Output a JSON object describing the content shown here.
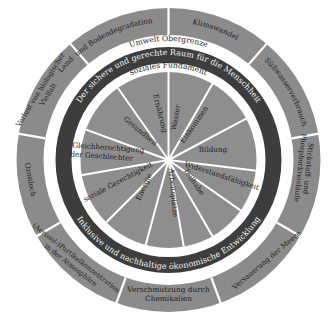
{
  "diagram": {
    "center": {
      "x": 168.5,
      "y": 160
    },
    "colors": {
      "background": "#ffffff",
      "outer_ring": "#8b8b8b",
      "band": "#ffffff",
      "dark_ring": "#3d3d3d",
      "inner_pie": "#8e8e8e",
      "divider": "#ffffff",
      "text_dark": "#1e1e1e",
      "text_light": "#f2f2f2"
    },
    "outer_ring": {
      "title": "Umwelt Obergrenze",
      "segments": [
        {
          "label": "Klimawandel"
        },
        {
          "label": "Süßwasserverbrauch"
        },
        {
          "label": "Stickstoff- und Phosphorkreisläufe"
        },
        {
          "label": "Versauerung der Meere"
        },
        {
          "label": "Verschmutzung durch Chemikalien"
        },
        {
          "label": "(Aerosol-)Partikelkonzentration in der Atmosphäre"
        },
        {
          "label": "Ozonloch"
        },
        {
          "label": "Verlust von biologischer Vielfalt"
        },
        {
          "label": "Land- und Bodendegradation"
        }
      ]
    },
    "dark_ring": {
      "top_text": "Der sichere und gerechte Raum für die Menschheit",
      "bottom_text": "Inklusive und nachhaltige ökonomische Entwicklung"
    },
    "inner_band": {
      "title": "soziales Fundament"
    },
    "inner_pie": {
      "segments": [
        {
          "label": "Wasser"
        },
        {
          "label": "Einkommen"
        },
        {
          "label": "Bildung"
        },
        {
          "label": "Widerstandsfähigkeit"
        },
        {
          "label": "Teilhabe"
        },
        {
          "label": "Arbeitsplätze"
        },
        {
          "label": "Energie"
        },
        {
          "label": "soziale Gerechtigkeit"
        },
        {
          "label": "Gleichberechtigung der Geschlechter"
        },
        {
          "label": "Gesundheit"
        },
        {
          "label": "Ernährung"
        }
      ]
    }
  }
}
